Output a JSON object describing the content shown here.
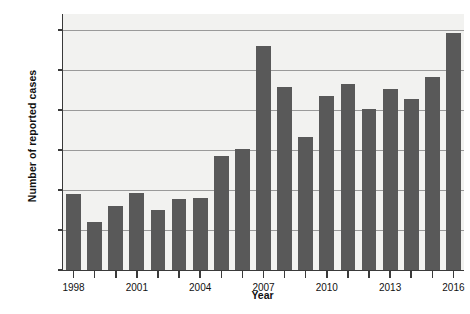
{
  "chart_data": {
    "type": "bar",
    "title": "",
    "xlabel": "Year",
    "ylabel": "Number of reported cases",
    "categories": [
      "1998",
      "1999",
      "2000",
      "2001",
      "2002",
      "2003",
      "2004",
      "2005",
      "2006",
      "2007",
      "2008",
      "2009",
      "2010",
      "2011",
      "2012",
      "2013",
      "2014",
      "2015",
      "2016"
    ],
    "values": [
      3800,
      2420,
      3180,
      3840,
      3020,
      3530,
      3620,
      5720,
      6060,
      11200,
      9150,
      6650,
      8680,
      9280,
      8050,
      9060,
      8550,
      9650,
      11850
    ],
    "ylim": [
      0,
      12800
    ],
    "yticks": [
      0,
      2000,
      4000,
      6000,
      8000,
      10000,
      12000
    ],
    "ytick_labels": [
      "0",
      "2,000",
      "4,000",
      "6,000",
      "8,000",
      "10,000",
      "12,000"
    ],
    "xtick_labels": [
      "1998",
      "2001",
      "2004",
      "2007",
      "2010",
      "2013",
      "2016"
    ],
    "xtick_categories": [
      "1998",
      "2001",
      "2004",
      "2007",
      "2010",
      "2013",
      "2016"
    ],
    "grid": true,
    "legend": false,
    "bar_color": "#595959",
    "plot_background": "#f2f2f0",
    "axis_color": "#3a3a3a",
    "gridline_color": "#9a9a9a"
  }
}
